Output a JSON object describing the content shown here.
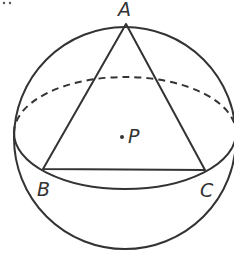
{
  "diagram": {
    "stroke_color": "#333333",
    "labels": {
      "A": "A",
      "B": "B",
      "C": "C",
      "P": "P"
    },
    "points": {
      "A": [
        126,
        24
      ],
      "B": [
        43,
        169
      ],
      "C": [
        205,
        170
      ],
      "P": [
        122,
        137
      ]
    }
  }
}
